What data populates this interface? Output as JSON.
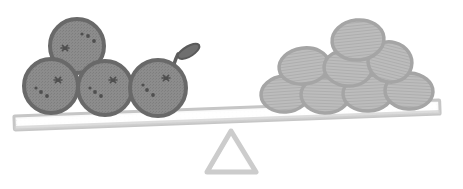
{
  "canvas": {
    "width": 463,
    "height": 189,
    "background": "#ffffff",
    "title": "Balance scale with oranges and stones"
  },
  "palette": {
    "orange_fill": "#8c8c8c",
    "orange_stroke": "#6a6a6a",
    "orange_speck": "#4f4f4f",
    "stone_fill": "#b8b8b8",
    "stone_stroke": "#9d9d9d",
    "stone_line": "#a8a8a8",
    "beam_fill": "#fbfbfb",
    "beam_stroke": "#c9c9c9",
    "fulcrum_fill": "#fcfcfc",
    "fulcrum_stroke": "#cfcfcf",
    "leaf_fill": "#6f6f6f",
    "leaf_stroke": "#5a5a5a"
  },
  "scale": {
    "name": "balance-scale",
    "tilt_degrees": -2.2,
    "left_pan_label": "left pan",
    "right_pan_label": "right pan",
    "beam": {
      "name": "beam",
      "x1": 14,
      "y1": 122,
      "x2": 440,
      "y2": 106,
      "thickness": 13
    },
    "fulcrum": {
      "name": "fulcrum",
      "apex_x": 231,
      "apex_y": 131,
      "base_left_x": 207,
      "base_right_x": 256,
      "base_y": 172
    }
  },
  "left_group": {
    "name": "oranges",
    "count": 4,
    "item_label": "orange",
    "items": [
      {
        "cx": 77,
        "cy": 46,
        "r": 27,
        "label": "orange-top"
      },
      {
        "cx": 51,
        "cy": 86,
        "r": 27,
        "label": "orange-left"
      },
      {
        "cx": 105,
        "cy": 88,
        "r": 27,
        "label": "orange-middle"
      },
      {
        "cx": 158,
        "cy": 88,
        "r": 28,
        "label": "orange-right"
      }
    ],
    "leaf": {
      "name": "leaf",
      "stem_x": 175,
      "stem_y": 66,
      "tip_x": 187,
      "tip_y": 43
    }
  },
  "right_group": {
    "name": "stones",
    "count": 8,
    "item_label": "stone",
    "rows": [
      {
        "row": "bottom",
        "items": [
          {
            "cx": 285,
            "cy": 94,
            "rx": 24,
            "ry": 18,
            "rot": -4
          },
          {
            "cx": 325,
            "cy": 95,
            "rx": 24,
            "ry": 18,
            "rot": 2
          },
          {
            "cx": 368,
            "cy": 93,
            "rx": 25,
            "ry": 18,
            "rot": -3
          },
          {
            "cx": 409,
            "cy": 91,
            "rx": 24,
            "ry": 18,
            "rot": 3
          }
        ]
      },
      {
        "row": "middle",
        "items": [
          {
            "cx": 304,
            "cy": 66,
            "rx": 25,
            "ry": 18,
            "rot": -8
          },
          {
            "cx": 348,
            "cy": 68,
            "rx": 24,
            "ry": 18,
            "rot": 4
          },
          {
            "cx": 390,
            "cy": 62,
            "rx": 22,
            "ry": 20,
            "rot": 14
          }
        ]
      },
      {
        "row": "top",
        "items": [
          {
            "cx": 358,
            "cy": 40,
            "rx": 26,
            "ry": 20,
            "rot": -6
          }
        ]
      }
    ]
  },
  "specks": {
    "name": "orange-specks",
    "marks": [
      {
        "cx": 65,
        "cy": 48,
        "type": "star"
      },
      {
        "cx": 88,
        "cy": 36,
        "type": "dot"
      },
      {
        "cx": 94,
        "cy": 41,
        "type": "dot"
      },
      {
        "cx": 82,
        "cy": 34,
        "type": "dot"
      },
      {
        "cx": 58,
        "cy": 80,
        "type": "star"
      },
      {
        "cx": 41,
        "cy": 92,
        "type": "dot"
      },
      {
        "cx": 47,
        "cy": 96,
        "type": "dot"
      },
      {
        "cx": 36,
        "cy": 88,
        "type": "dot"
      },
      {
        "cx": 113,
        "cy": 80,
        "type": "star"
      },
      {
        "cx": 95,
        "cy": 92,
        "type": "dot"
      },
      {
        "cx": 101,
        "cy": 96,
        "type": "dot"
      },
      {
        "cx": 90,
        "cy": 88,
        "type": "dot"
      },
      {
        "cx": 166,
        "cy": 78,
        "type": "star"
      },
      {
        "cx": 147,
        "cy": 90,
        "type": "dot"
      },
      {
        "cx": 153,
        "cy": 95,
        "type": "dot"
      },
      {
        "cx": 143,
        "cy": 85,
        "type": "dot"
      }
    ]
  }
}
